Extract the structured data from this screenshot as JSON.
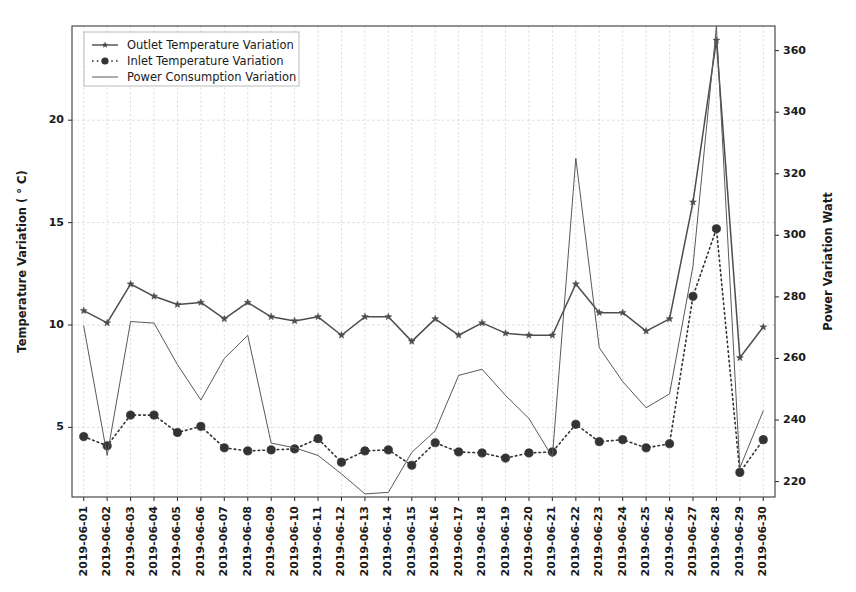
{
  "figure": {
    "background": "#ffffff",
    "line_color": "#4d4d4d",
    "axis_color": "#3a3a3a",
    "grid_color": "#cfcfcf"
  },
  "legend": {
    "position": "upper-left",
    "entries": [
      {
        "label": "Outlet Temperature Variation",
        "style": "solid-with-star-markers",
        "color": "#4d4d4d"
      },
      {
        "label": "Inlet Temperature Variation",
        "style": "dotted-with-circle-markers",
        "color": "#333333"
      },
      {
        "label": "Power Consumption Variation",
        "style": "thin-solid",
        "color": "#595959"
      }
    ]
  },
  "axes": {
    "y_left": {
      "label": "Temperature Variation ( ° C)",
      "ticks": [
        5,
        10,
        15,
        20
      ],
      "min": 1.6,
      "max": 24.6
    },
    "y_right": {
      "label": "Power Variation Watt",
      "ticks": [
        220,
        240,
        260,
        280,
        300,
        320,
        340,
        360
      ],
      "min": 215.0,
      "max": 368.0
    },
    "x": {
      "label": "",
      "tick_rotation": 90,
      "ticks": [
        "2019-06-01",
        "2019-06-02",
        "2019-06-03",
        "2019-06-04",
        "2019-06-05",
        "2019-06-06",
        "2019-06-07",
        "2019-06-08",
        "2019-06-09",
        "2019-06-10",
        "2019-06-11",
        "2019-06-12",
        "2019-06-13",
        "2019-06-14",
        "2019-06-15",
        "2019-06-16",
        "2019-06-17",
        "2019-06-18",
        "2019-06-19",
        "2019-06-20",
        "2019-06-21",
        "2019-06-22",
        "2019-06-23",
        "2019-06-24",
        "2019-06-25",
        "2019-06-26",
        "2019-06-27",
        "2019-06-28",
        "2019-06-29",
        "2019-06-30"
      ]
    }
  },
  "chart_data": {
    "type": "line",
    "title": "",
    "xlabel": "",
    "ylabel": "Temperature Variation ( ° C)",
    "y2label": "Power Variation Watt",
    "ylim": [
      1.6,
      24.6
    ],
    "y2lim": [
      215.0,
      368.0
    ],
    "grid": true,
    "legend_position": "upper-left",
    "x": [
      "2019-06-01",
      "2019-06-02",
      "2019-06-03",
      "2019-06-04",
      "2019-06-05",
      "2019-06-06",
      "2019-06-07",
      "2019-06-08",
      "2019-06-09",
      "2019-06-10",
      "2019-06-11",
      "2019-06-12",
      "2019-06-13",
      "2019-06-14",
      "2019-06-15",
      "2019-06-16",
      "2019-06-17",
      "2019-06-18",
      "2019-06-19",
      "2019-06-20",
      "2019-06-21",
      "2019-06-22",
      "2019-06-23",
      "2019-06-24",
      "2019-06-25",
      "2019-06-26",
      "2019-06-27",
      "2019-06-28",
      "2019-06-29",
      "2019-06-30"
    ],
    "series": [
      {
        "name": "Outlet Temperature Variation",
        "axis": "left",
        "unit": "°C",
        "marker": "star",
        "linestyle": "solid",
        "color": "#4d4d4d",
        "values": [
          10.7,
          10.1,
          12.0,
          11.4,
          11.0,
          11.1,
          10.3,
          11.1,
          10.4,
          10.2,
          10.4,
          9.5,
          10.4,
          10.4,
          9.2,
          10.3,
          9.5,
          10.1,
          9.6,
          9.5,
          9.5,
          12.0,
          10.6,
          10.6,
          9.7,
          10.3,
          16.0,
          23.9,
          8.4,
          9.9
        ]
      },
      {
        "name": "Inlet Temperature Variation",
        "axis": "left",
        "unit": "°C",
        "marker": "circle",
        "linestyle": "dotted",
        "color": "#333333",
        "values": [
          4.55,
          4.1,
          5.6,
          5.6,
          4.75,
          5.05,
          4.0,
          3.85,
          3.9,
          3.95,
          4.45,
          3.3,
          3.85,
          3.9,
          3.15,
          4.25,
          3.8,
          3.75,
          3.5,
          3.75,
          3.8,
          5.15,
          4.3,
          4.4,
          4.0,
          4.2,
          11.4,
          14.7,
          2.8,
          4.4
        ]
      },
      {
        "name": "Power Consumption Variation",
        "axis": "right",
        "unit": "Watt",
        "marker": "none",
        "linestyle": "solid",
        "color": "#595959",
        "values": [
          270.5,
          228.5,
          272.0,
          271.5,
          258.0,
          246.5,
          260.0,
          267.5,
          232.5,
          231.0,
          228.5,
          222.5,
          216.0,
          216.5,
          229.5,
          236.5,
          254.5,
          256.5,
          248.0,
          240.5,
          228.0,
          325.0,
          263.5,
          252.5,
          244.0,
          248.5,
          290.0,
          368.0,
          224.5,
          243.0
        ]
      }
    ]
  }
}
